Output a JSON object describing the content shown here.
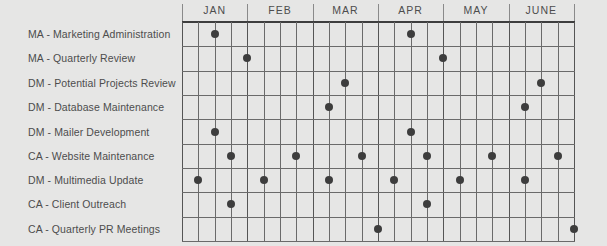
{
  "chart_data": {
    "type": "scatter",
    "title": "",
    "subtype": "timeline-grid",
    "months": [
      "JAN",
      "FEB",
      "MAR",
      "APR",
      "MAY",
      "JUNE"
    ],
    "weeks_per_month": 4,
    "x_description": "Week gridline index (0 = start of JAN, 24 = end of JUNE)",
    "rows": [
      {
        "label": "MA - Marketing Administration",
        "weeks": [
          2,
          14
        ]
      },
      {
        "label": "MA - Quarterly Review",
        "weeks": [
          4,
          16
        ]
      },
      {
        "label": "DM - Potential Projects Review",
        "weeks": [
          10,
          22
        ]
      },
      {
        "label": "DM - Database Maintenance",
        "weeks": [
          9,
          21
        ]
      },
      {
        "label": "DM - Mailer Development",
        "weeks": [
          2,
          14
        ]
      },
      {
        "label": "CA - Website Maintenance",
        "weeks": [
          3,
          7,
          11,
          15,
          19,
          23
        ]
      },
      {
        "label": "DM - Multimedia Update",
        "weeks": [
          1,
          5,
          9,
          13,
          17,
          21
        ]
      },
      {
        "label": "CA - Client Outreach",
        "weeks": [
          3,
          15
        ]
      },
      {
        "label": "CA - Quarterly PR Meetings",
        "weeks": [
          12,
          24
        ]
      }
    ],
    "grid": true,
    "legend": null
  },
  "colors": {
    "background": "#e6e6e5",
    "grid_line": "#6a6a6a",
    "header_line": "#3e3e3e",
    "dot": "#3d3d3d",
    "text": "#4d4d4d"
  }
}
